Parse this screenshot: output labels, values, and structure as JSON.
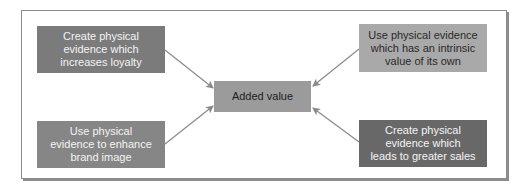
{
  "diagram": {
    "center": {
      "label": "Added value"
    },
    "nodes": [
      {
        "id": "top-left",
        "lines": [
          "Create physical",
          "evidence which",
          "increases loyalty"
        ]
      },
      {
        "id": "top-right",
        "lines": [
          "Use physical evidence",
          "which has an intrinsic",
          "value of its own"
        ]
      },
      {
        "id": "bottom-left",
        "lines": [
          "Use physical",
          "evidence to enhance",
          "brand image"
        ]
      },
      {
        "id": "bottom-right",
        "lines": [
          "Create physical",
          "evidence which",
          "leads to greater sales"
        ]
      }
    ],
    "edges": [
      {
        "from": "top-left",
        "to": "center"
      },
      {
        "from": "top-right",
        "to": "center"
      },
      {
        "from": "bottom-left",
        "to": "center"
      },
      {
        "from": "bottom-right",
        "to": "center"
      }
    ],
    "colors": {
      "top_left_fill": "#7b7b7b",
      "top_right_fill": "#a9a9a9",
      "bottom_left_fill": "#868686",
      "bottom_right_fill": "#686868",
      "center_fill": "#9b9b9b",
      "arrow": "#8a8a8a"
    }
  }
}
